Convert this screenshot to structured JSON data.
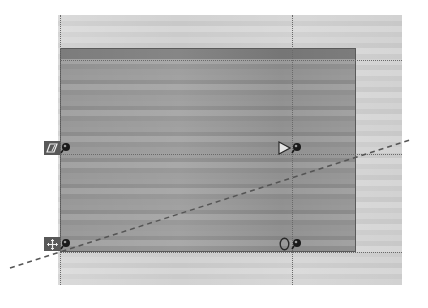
{
  "canvas": {
    "background_color": "#ffffff",
    "image_area": {
      "x": 58,
      "y": 15,
      "width": 344,
      "height": 270
    },
    "selection": {
      "x": 60,
      "y": 48,
      "width": 296,
      "height": 204,
      "border_color": "#5a5a5a"
    }
  },
  "guides": {
    "vertical": [
      60,
      292
    ],
    "horizontal": [
      60,
      154,
      252
    ]
  },
  "dashed_line": {
    "x1": 10,
    "y1": 268,
    "x2": 410,
    "y2": 140,
    "color": "#555555"
  },
  "handles": [
    {
      "name": "skew-handle",
      "icon": "skew-icon",
      "x": 44,
      "y": 140,
      "glyph": "▱"
    },
    {
      "name": "move-handle",
      "icon": "move-icon",
      "x": 44,
      "y": 236,
      "glyph": "✥"
    },
    {
      "name": "perspective-handle",
      "icon": "triangle-right-icon",
      "x": 277,
      "y": 140,
      "glyph": "▷"
    },
    {
      "name": "rotate-handle",
      "icon": "rotate-icon",
      "x": 277,
      "y": 236,
      "glyph": "O"
    }
  ]
}
